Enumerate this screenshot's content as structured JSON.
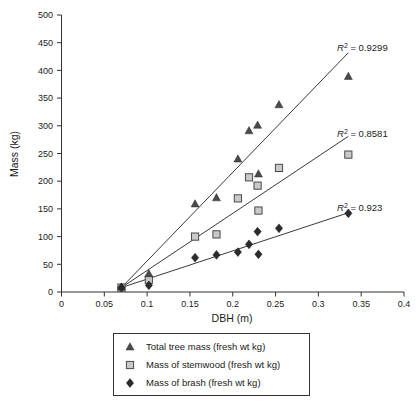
{
  "chart_data": {
    "type": "scatter",
    "title": "",
    "xlabel": "DBH (m)",
    "ylabel": "Mass (kg)",
    "xlim": [
      0,
      0.4
    ],
    "ylim": [
      0,
      500
    ],
    "xticks": [
      0,
      0.05,
      0.1,
      0.15,
      0.2,
      0.25,
      0.3,
      0.35,
      0.4
    ],
    "xticklabels": [
      "0",
      "0.05",
      "0.1",
      "0.15",
      "0.2",
      "0.25",
      "0.3",
      "0.35",
      "0.4"
    ],
    "yticks": [
      0,
      50,
      100,
      150,
      200,
      250,
      300,
      350,
      400,
      450,
      500
    ],
    "yticklabels": [
      "0",
      "50",
      "100",
      "150",
      "200",
      "250",
      "300",
      "350",
      "400",
      "450",
      "500"
    ],
    "grid": false,
    "legend_position": "below",
    "series": [
      {
        "name": "Total tree mass (fresh wt kg)",
        "marker": "triangle",
        "color": "#4a4a4a",
        "r_squared": "0.9299",
        "trendline": {
          "x0": 0.07,
          "y0": 8,
          "x1": 0.335,
          "y1": 432
        },
        "points": [
          {
            "x": 0.07,
            "y": 9
          },
          {
            "x": 0.102,
            "y": 33
          },
          {
            "x": 0.156,
            "y": 159
          },
          {
            "x": 0.181,
            "y": 170
          },
          {
            "x": 0.206,
            "y": 240
          },
          {
            "x": 0.219,
            "y": 291
          },
          {
            "x": 0.229,
            "y": 301
          },
          {
            "x": 0.23,
            "y": 213
          },
          {
            "x": 0.254,
            "y": 338
          },
          {
            "x": 0.335,
            "y": 389
          }
        ]
      },
      {
        "name": "Mass of stemwood (fresh wt kg)",
        "marker": "square",
        "color": "#c9c9c9",
        "r_squared": "0.8581",
        "trendline": {
          "x0": 0.07,
          "y0": 8,
          "x1": 0.335,
          "y1": 281
        },
        "points": [
          {
            "x": 0.07,
            "y": 8
          },
          {
            "x": 0.102,
            "y": 22
          },
          {
            "x": 0.156,
            "y": 100
          },
          {
            "x": 0.181,
            "y": 104
          },
          {
            "x": 0.206,
            "y": 169
          },
          {
            "x": 0.219,
            "y": 207
          },
          {
            "x": 0.229,
            "y": 192
          },
          {
            "x": 0.23,
            "y": 147
          },
          {
            "x": 0.254,
            "y": 224
          },
          {
            "x": 0.335,
            "y": 248
          }
        ]
      },
      {
        "name": "Mass of brash (fresh wt kg)",
        "marker": "diamond",
        "color": "#2b2b2b",
        "r_squared": "0.923",
        "trendline": {
          "x0": 0.07,
          "y0": 8,
          "x1": 0.335,
          "y1": 143
        },
        "points": [
          {
            "x": 0.07,
            "y": 8
          },
          {
            "x": 0.102,
            "y": 12
          },
          {
            "x": 0.156,
            "y": 62
          },
          {
            "x": 0.181,
            "y": 67
          },
          {
            "x": 0.206,
            "y": 72
          },
          {
            "x": 0.219,
            "y": 86
          },
          {
            "x": 0.229,
            "y": 109
          },
          {
            "x": 0.23,
            "y": 68
          },
          {
            "x": 0.254,
            "y": 115
          },
          {
            "x": 0.335,
            "y": 142
          }
        ]
      }
    ],
    "annotations": [
      {
        "name": "r2-total-tree-mass",
        "prefix": "R",
        "sup": "2",
        "text": " = 0.9299",
        "x": 337,
        "y": 51
      },
      {
        "name": "r2-stemwood",
        "prefix": "R",
        "sup": "2",
        "text": " = 0.8581",
        "x": 337,
        "y": 137
      },
      {
        "name": "r2-brash",
        "prefix": "R",
        "sup": "2",
        "text": " = 0.923",
        "x": 337,
        "y": 211
      }
    ]
  },
  "legend": {
    "items": [
      {
        "label": "Total tree mass (fresh wt kg)",
        "marker": "triangle"
      },
      {
        "label": "Mass of stemwood (fresh wt kg)",
        "marker": "square"
      },
      {
        "label": "Mass of brash (fresh wt kg)",
        "marker": "diamond"
      }
    ]
  }
}
